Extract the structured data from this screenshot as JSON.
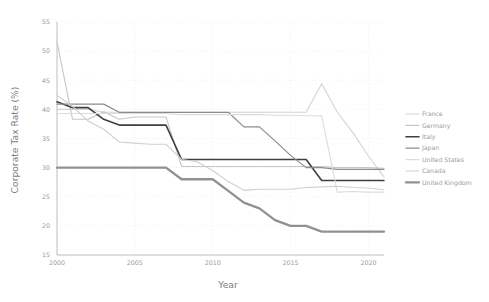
{
  "chart_data": {
    "type": "line",
    "title": "",
    "xlabel": "Year",
    "ylabel": "Corporate Tax Rate (%)",
    "xlim": [
      2000,
      2021
    ],
    "ylim": [
      15,
      55
    ],
    "xticks": [
      2000,
      2005,
      2010,
      2015,
      2020
    ],
    "xtick_labels": [
      "2000",
      "2005",
      "2010",
      "2015",
      "2020"
    ],
    "yticks": [
      15,
      20,
      25,
      30,
      35,
      40,
      45,
      50,
      55
    ],
    "ytick_labels": [
      "15",
      "20",
      "25",
      "30",
      "35",
      "40",
      "45",
      "50",
      "55"
    ],
    "grid": true,
    "legend_position": "right",
    "x": [
      2000,
      2001,
      2002,
      2003,
      2004,
      2005,
      2006,
      2007,
      2008,
      2009,
      2010,
      2011,
      2012,
      2013,
      2014,
      2015,
      2016,
      2017,
      2018,
      2019,
      2020,
      2021
    ],
    "series": [
      {
        "name": "France",
        "color": "#d3d3d3",
        "width": 1.1,
        "values": [
          40.0,
          40.0,
          40.0,
          39.5,
          39.5,
          39.5,
          39.5,
          39.5,
          39.5,
          39.5,
          39.5,
          39.5,
          39.5,
          39.5,
          39.5,
          39.5,
          39.5,
          44.4,
          39.5,
          36.0,
          32.0,
          28.4
        ]
      },
      {
        "name": "Germany",
        "color": "#c6c6c6",
        "width": 1.1,
        "values": [
          51.6,
          38.3,
          38.3,
          39.6,
          38.3,
          38.7,
          38.7,
          38.7,
          30.2,
          30.2,
          30.2,
          30.2,
          30.2,
          30.2,
          30.2,
          30.2,
          30.2,
          30.2,
          30.0,
          30.0,
          30.0,
          29.9
        ]
      },
      {
        "name": "Italy",
        "color": "#3f3f3f",
        "width": 1.6,
        "values": [
          41.3,
          40.3,
          40.3,
          38.3,
          37.3,
          37.3,
          37.3,
          37.3,
          31.4,
          31.4,
          31.4,
          31.4,
          31.4,
          31.4,
          31.4,
          31.4,
          31.4,
          27.8,
          27.8,
          27.8,
          27.8,
          27.8
        ]
      },
      {
        "name": "Japan",
        "color": "#8c8c8c",
        "width": 1.2,
        "values": [
          40.9,
          40.9,
          40.9,
          40.9,
          39.5,
          39.5,
          39.5,
          39.5,
          39.5,
          39.5,
          39.5,
          39.5,
          37.0,
          37.0,
          34.6,
          32.1,
          30.0,
          30.0,
          29.7,
          29.7,
          29.7,
          29.7
        ]
      },
      {
        "name": "United States",
        "color": "#dcdcdc",
        "width": 1.1,
        "values": [
          39.3,
          39.3,
          39.3,
          39.3,
          39.3,
          39.3,
          39.3,
          39.3,
          39.1,
          39.1,
          39.1,
          39.1,
          39.1,
          39.1,
          39.0,
          39.0,
          38.9,
          38.9,
          25.8,
          25.9,
          25.8,
          25.8
        ]
      },
      {
        "name": "Canada",
        "color": "#cfcfcf",
        "width": 1.1,
        "values": [
          42.4,
          40.5,
          38.0,
          36.6,
          34.4,
          34.2,
          34.0,
          34.0,
          31.4,
          31.0,
          29.5,
          27.6,
          26.1,
          26.3,
          26.3,
          26.3,
          26.6,
          26.7,
          26.8,
          26.6,
          26.5,
          26.2
        ]
      },
      {
        "name": "United Kingdom",
        "color": "#919191",
        "width": 2.3,
        "values": [
          30.0,
          30.0,
          30.0,
          30.0,
          30.0,
          30.0,
          30.0,
          30.0,
          28.0,
          28.0,
          28.0,
          26.0,
          24.0,
          23.0,
          21.0,
          20.0,
          20.0,
          19.0,
          19.0,
          19.0,
          19.0,
          19.0
        ]
      }
    ]
  },
  "legend": {
    "entries": [
      {
        "label": "France"
      },
      {
        "label": "Germany"
      },
      {
        "label": "Italy"
      },
      {
        "label": "Japan"
      },
      {
        "label": "United States"
      },
      {
        "label": "Canada"
      },
      {
        "label": "United Kingdom"
      }
    ]
  }
}
